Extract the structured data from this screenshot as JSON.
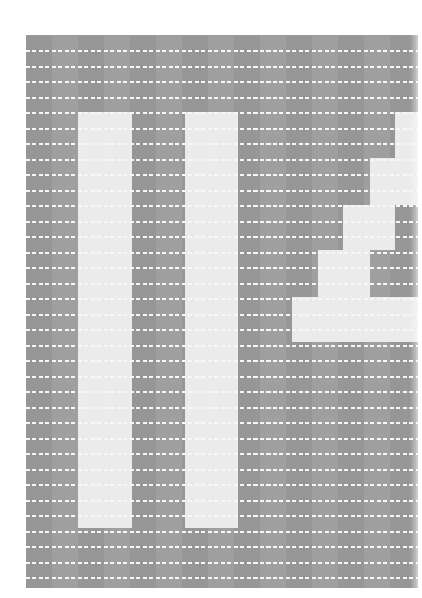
{
  "figure": {
    "colors": {
      "background": "#ffffff",
      "grid_dark": "#9c9c9c",
      "grid_light": "#ebebeb",
      "dash": "#f7f7f7"
    },
    "grid": {
      "left": 26,
      "top": 35,
      "width": 392,
      "height": 553,
      "row_pitch": 15.5,
      "row_count": 35
    },
    "light_blocks": [
      {
        "name": "left-vertical-bar",
        "x": 78,
        "y": 112,
        "w": 54,
        "h": 416
      },
      {
        "name": "middle-vertical-bar",
        "x": 185,
        "y": 112,
        "w": 53,
        "h": 416
      },
      {
        "name": "staircase-step-1",
        "x": 395,
        "y": 112,
        "w": 23,
        "h": 46
      },
      {
        "name": "staircase-step-2",
        "x": 370,
        "y": 158,
        "w": 48,
        "h": 47
      },
      {
        "name": "staircase-step-3",
        "x": 343,
        "y": 205,
        "w": 52,
        "h": 45
      },
      {
        "name": "staircase-step-4",
        "x": 318,
        "y": 250,
        "w": 52,
        "h": 47
      },
      {
        "name": "staircase-step-5",
        "x": 292,
        "y": 297,
        "w": 126,
        "h": 45
      }
    ]
  }
}
